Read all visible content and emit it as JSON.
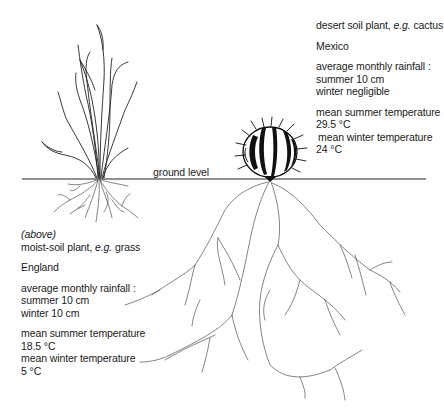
{
  "diagram": {
    "ground_label": "ground level",
    "cactus": {
      "title_prefix": "desert soil plant, ",
      "title_eg": "e.g.",
      "title_suffix": " cactus",
      "country": "Mexico",
      "rainfall_label": "average monthly rainfall :",
      "rainfall_summer": "summer 10 cm",
      "rainfall_winter": "winter negligible",
      "summer_temp_label": "mean summer temperature",
      "summer_temp_value": "29.5 °C",
      "winter_temp_label": "mean winter temperature",
      "winter_temp_value": "24 °C"
    },
    "grass": {
      "position_note": "(above)",
      "title_prefix": "moist-soil plant, ",
      "title_eg": "e.g.",
      "title_suffix": " grass",
      "country": "England",
      "rainfall_label": "average monthly rainfall :",
      "rainfall_summer": "summer 10 cm",
      "rainfall_winter": "winter 10 cm",
      "summer_temp_label": "mean summer temperature",
      "summer_temp_value": "18.5 °C",
      "winter_temp_label": "mean winter temperature",
      "winter_temp_value": "5 °C"
    },
    "colors": {
      "ink": "#1a1a1a",
      "background": "#ffffff"
    }
  }
}
